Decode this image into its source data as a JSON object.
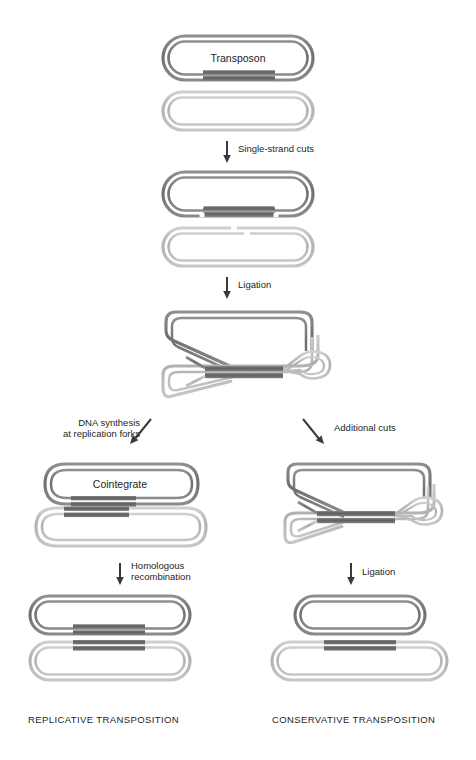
{
  "figure": {
    "type": "biology-process-diagram",
    "title_visible": false,
    "palette": {
      "donor_strand": "#7b7b7b",
      "donor_strand_dark": "#6a6a6a",
      "target_strand": "#b5b5b5",
      "target_strand_light": "#c9c9c9",
      "transposon": "#6e6e6e",
      "transposon_dark": "#5c5c5c",
      "background": "#ffffff",
      "text": "#231f20",
      "arrow": "#3a3a3a",
      "nick": "#ffffff"
    }
  },
  "structures": {
    "stage1_donor": {
      "label": "Transposon"
    },
    "stage1_target": {
      "label": ""
    },
    "stage2_donor": {
      "label": ""
    },
    "stage2_target": {
      "label": ""
    },
    "stage3_intermediate": {
      "label": ""
    },
    "left_cointegrate": {
      "label": "Cointegrate"
    },
    "right_cut_intermediate": {
      "label": ""
    },
    "left_product_top": {
      "label": ""
    },
    "left_product_bottom": {
      "label": ""
    },
    "right_product_top": {
      "label": ""
    },
    "right_product_bottom": {
      "label": ""
    }
  },
  "steps": {
    "step1": {
      "label": "Single-strand cuts"
    },
    "step2": {
      "label": "Ligation"
    },
    "step3_left_line1": {
      "label": "DNA synthesis"
    },
    "step3_left_line2": {
      "label": "at replication forks"
    },
    "step3_right": {
      "label": "Additional cuts"
    },
    "step4_left_line1": {
      "label": "Homologous"
    },
    "step4_left_line2": {
      "label": "recombination"
    },
    "step4_right": {
      "label": "Ligation"
    }
  },
  "captions": {
    "left": "REPLICATIVE TRANSPOSITION",
    "right": "CONSERVATIVE TRANSPOSITION"
  }
}
